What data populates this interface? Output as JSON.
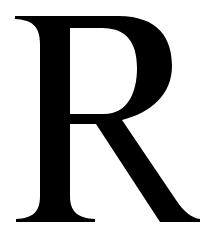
{
  "glyph": {
    "character": "R",
    "color": "#000000",
    "background": "#ffffff"
  }
}
